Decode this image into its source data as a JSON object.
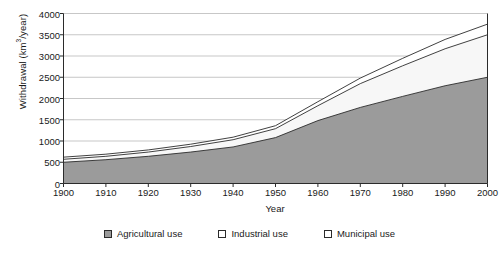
{
  "chart_data": {
    "type": "area",
    "title": "",
    "xlabel": "Year",
    "ylabel": "Withdrawal (km3/year)",
    "ylabel_base": "Withdrawal (km",
    "ylabel_sup": "3",
    "ylabel_tail": "/year)",
    "stacked": true,
    "grid": true,
    "legend_position": "bottom",
    "x": [
      1900,
      1910,
      1920,
      1930,
      1940,
      1950,
      1960,
      1970,
      1980,
      1990,
      2000
    ],
    "xlim": [
      1900,
      2000
    ],
    "ylim": [
      0,
      4000
    ],
    "xticks": [
      1900,
      1910,
      1920,
      1930,
      1940,
      1950,
      1960,
      1970,
      1980,
      1990,
      2000
    ],
    "yticks": [
      0,
      500,
      1000,
      1500,
      2000,
      2500,
      3000,
      3500,
      4000
    ],
    "series": [
      {
        "name": "Agricultural use",
        "color": "#9b9b9b",
        "swatch": "filled",
        "values": [
          500,
          560,
          640,
          740,
          860,
          1080,
          1480,
          1790,
          2050,
          2300,
          2500
        ]
      },
      {
        "name": "Industrial use",
        "color": "#f7f7f7",
        "swatch": "empty",
        "values": [
          70,
          80,
          100,
          130,
          170,
          210,
          350,
          560,
          720,
          870,
          1000
        ]
      },
      {
        "name": "Municipal use",
        "color": "#ffffff",
        "swatch": "empty",
        "values": [
          50,
          50,
          50,
          55,
          60,
          70,
          95,
          130,
          175,
          220,
          250
        ]
      }
    ],
    "totals": [
      620,
      690,
      790,
      925,
      1090,
      1360,
      1925,
      2480,
      2945,
      3390,
      3750
    ]
  }
}
